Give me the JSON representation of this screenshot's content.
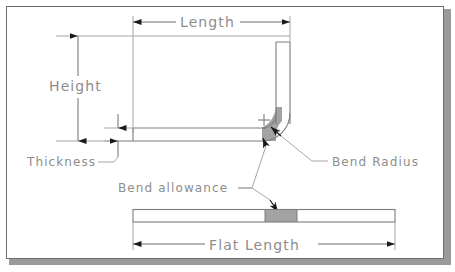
{
  "diagram": {
    "frame": {
      "border_color": "#6e6e6e",
      "shadow_color": "#9a9a9a",
      "background": "#ffffff"
    },
    "colors": {
      "outline": "#7d7d7d",
      "dimension_line": "#6f6f6f",
      "text": "#8d8d8d",
      "bend_fill": "#a3a3a3",
      "arrow_fill": "#1a1a1a"
    },
    "labels": {
      "length": "Length",
      "height": "Height",
      "thickness": "Thickness",
      "bend_radius": "Bend Radius",
      "bend_allowance": "Bend allowance",
      "flat_length": "Flat Length"
    },
    "parts": [
      {
        "name": "bent-part",
        "shape": "L-profile",
        "description": "Sheet metal part bent 90 degrees with a radiused corner"
      },
      {
        "name": "flat-blank",
        "shape": "rectangle-strip",
        "description": "Unfolded flat blank with shaded bend allowance region"
      }
    ],
    "dimensions": [
      {
        "name": "length",
        "label": "Length",
        "orientation": "horizontal",
        "applies_to": "bent-part"
      },
      {
        "name": "height",
        "label": "Height",
        "orientation": "vertical",
        "applies_to": "bent-part"
      },
      {
        "name": "thickness",
        "label": "Thickness",
        "orientation": "vertical",
        "applies_to": "bent-part"
      },
      {
        "name": "flat-length",
        "label": "Flat Length",
        "orientation": "horizontal",
        "applies_to": "flat-blank"
      }
    ],
    "callouts": [
      {
        "name": "bend-radius",
        "label": "Bend Radius",
        "points_to": "bend-arc"
      },
      {
        "name": "bend-allowance",
        "label": "Bend allowance",
        "points_to": "bend-allowance-region"
      }
    ],
    "markers": [
      {
        "name": "bend-center-mark",
        "glyph": "+",
        "meaning": "bend radius center point"
      }
    ]
  }
}
